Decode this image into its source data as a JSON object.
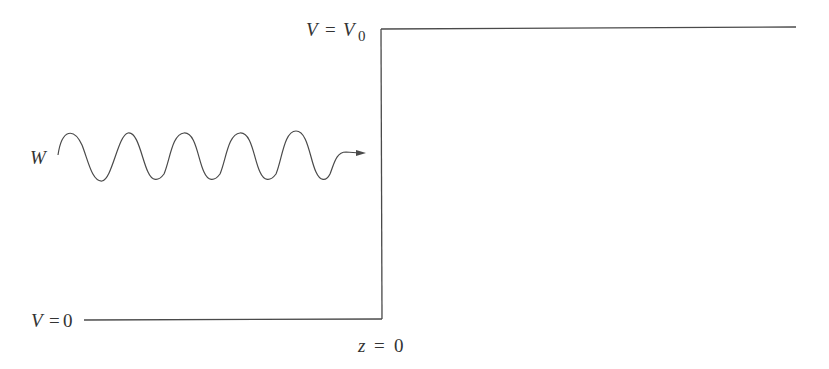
{
  "diagram": {
    "labels": {
      "top_potential": {
        "var": "V",
        "eq": "=",
        "rhs_var": "V",
        "rhs_sub": "0"
      },
      "bottom_potential": {
        "var": "V",
        "eq": "=",
        "rhs": "0"
      },
      "position": {
        "var": "z",
        "eq": "=",
        "rhs": "0"
      },
      "wave": {
        "var": "W"
      }
    },
    "colors": {
      "line": "#4a4a4a",
      "text": "#333333",
      "background": "#ffffff"
    }
  }
}
